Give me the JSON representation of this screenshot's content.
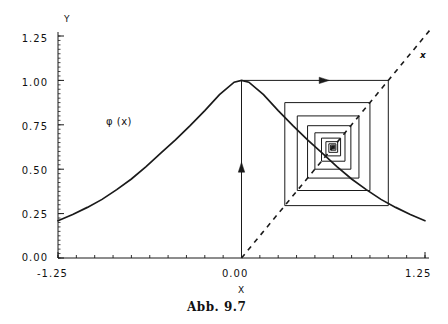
{
  "figure": {
    "caption": "Abb. 9.7",
    "curve_label": "φ (x)",
    "diagonal_label": "x"
  },
  "axes": {
    "y_axis_name": "Y",
    "x_axis_name": "X",
    "y_ticks": [
      "1.25",
      "1.00",
      "0.75",
      "0.50",
      "0.25",
      "0.00"
    ],
    "x_ticks": [
      "-1.25",
      "0.00",
      "1.25"
    ]
  },
  "chart_data": {
    "type": "line",
    "title": "Abb. 9.7",
    "xlabel": "X",
    "ylabel": "Y",
    "xlim": [
      -1.25,
      1.25
    ],
    "ylim": [
      0.0,
      1.25
    ],
    "grid": false,
    "legend": "none",
    "y_tick_values": [
      1.25,
      1.0,
      0.75,
      0.5,
      0.25,
      0.0
    ],
    "x_tick_values": [
      -1.25,
      0.0,
      1.25
    ],
    "minor_ticks": true,
    "series": [
      {
        "name": "φ (x)",
        "style": "solid",
        "annotation": "φ (x)",
        "x": [
          -1.25,
          -1.15,
          -1.05,
          -0.95,
          -0.85,
          -0.75,
          -0.65,
          -0.55,
          -0.45,
          -0.35,
          -0.25,
          -0.15,
          -0.05,
          0.0,
          0.05,
          0.15,
          0.25,
          0.35,
          0.45,
          0.55,
          0.65,
          0.75,
          0.85,
          0.95,
          1.05,
          1.15,
          1.25
        ],
        "y": [
          0.21,
          0.245,
          0.285,
          0.33,
          0.385,
          0.445,
          0.515,
          0.59,
          0.665,
          0.745,
          0.83,
          0.92,
          0.99,
          1.0,
          0.99,
          0.92,
          0.83,
          0.745,
          0.665,
          0.59,
          0.515,
          0.445,
          0.385,
          0.33,
          0.285,
          0.245,
          0.21
        ]
      },
      {
        "name": "x",
        "style": "dashed",
        "annotation": "x",
        "x": [
          0.0,
          1.25
        ],
        "y": [
          0.0,
          1.25
        ]
      },
      {
        "name": "cobweb",
        "style": "solid",
        "description": "cobweb iteration spiral converging to fixed point",
        "start_x": 0.0,
        "start_y": 0.0,
        "fixed_point": [
          0.625,
          0.625
        ],
        "arrow_up_at_x": 0.0,
        "arrow_right_at_y": 1.0,
        "points": [
          [
            0.0,
            0.0
          ],
          [
            0.0,
            1.0
          ],
          [
            1.0,
            1.0
          ],
          [
            1.0,
            0.295
          ],
          [
            0.295,
            0.295
          ],
          [
            0.295,
            0.875
          ],
          [
            0.875,
            0.875
          ],
          [
            0.875,
            0.38
          ],
          [
            0.38,
            0.38
          ],
          [
            0.38,
            0.8
          ],
          [
            0.8,
            0.8
          ],
          [
            0.8,
            0.45
          ],
          [
            0.45,
            0.45
          ],
          [
            0.45,
            0.745
          ],
          [
            0.745,
            0.745
          ],
          [
            0.745,
            0.5
          ],
          [
            0.5,
            0.5
          ],
          [
            0.5,
            0.705
          ],
          [
            0.705,
            0.705
          ],
          [
            0.705,
            0.545
          ],
          [
            0.545,
            0.545
          ],
          [
            0.545,
            0.675
          ],
          [
            0.675,
            0.675
          ],
          [
            0.675,
            0.575
          ],
          [
            0.575,
            0.575
          ],
          [
            0.575,
            0.655
          ],
          [
            0.655,
            0.655
          ],
          [
            0.655,
            0.595
          ],
          [
            0.595,
            0.595
          ],
          [
            0.595,
            0.643
          ],
          [
            0.643,
            0.643
          ],
          [
            0.643,
            0.607
          ],
          [
            0.607,
            0.607
          ],
          [
            0.607,
            0.636
          ],
          [
            0.636,
            0.636
          ],
          [
            0.636,
            0.614
          ],
          [
            0.614,
            0.614
          ],
          [
            0.614,
            0.631
          ],
          [
            0.631,
            0.631
          ],
          [
            0.631,
            0.618
          ],
          [
            0.618,
            0.618
          ],
          [
            0.618,
            0.628
          ],
          [
            0.628,
            0.628
          ],
          [
            0.628,
            0.621
          ],
          [
            0.621,
            0.621
          ],
          [
            0.621,
            0.627
          ],
          [
            0.627,
            0.627
          ],
          [
            0.627,
            0.623
          ],
          [
            0.623,
            0.623
          ],
          [
            0.623,
            0.626
          ],
          [
            0.626,
            0.626
          ],
          [
            0.626,
            0.624
          ],
          [
            0.624,
            0.624
          ],
          [
            0.624,
            0.6255
          ],
          [
            0.6255,
            0.6255
          ],
          [
            0.6255,
            0.6245
          ],
          [
            0.6245,
            0.6245
          ],
          [
            0.6245,
            0.6252
          ],
          [
            0.6252,
            0.6252
          ],
          [
            0.6252,
            0.6248
          ],
          [
            0.6248,
            0.6248
          ]
        ]
      }
    ]
  },
  "colors": {
    "ink": "#1a1a1a",
    "background": "#ffffff"
  }
}
